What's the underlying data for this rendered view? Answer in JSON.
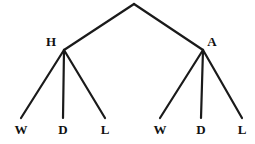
{
  "diagram": {
    "type": "tree",
    "background_color": "#ffffff",
    "stroke_color": "#1a1a1a",
    "text_color": "#111111",
    "stroke_width": 2.2,
    "width": 255,
    "height": 144,
    "nodes": [
      {
        "id": "root",
        "label": "",
        "x": 134,
        "y": 4,
        "level": 0,
        "kind": "root"
      },
      {
        "id": "h",
        "label": "H",
        "x": 64,
        "y": 50,
        "label_x": 51,
        "label_y": 41,
        "level": 1,
        "kind": "internal"
      },
      {
        "id": "a",
        "label": "A",
        "x": 203,
        "y": 50,
        "label_x": 212,
        "label_y": 41,
        "level": 1,
        "kind": "internal"
      },
      {
        "id": "h-w",
        "label": "W",
        "x": 21,
        "y": 118,
        "label_x": 21,
        "label_y": 129,
        "level": 2,
        "kind": "leaf",
        "parent": "h"
      },
      {
        "id": "h-d",
        "label": "D",
        "x": 63,
        "y": 118,
        "label_x": 63,
        "label_y": 129,
        "level": 2,
        "kind": "leaf",
        "parent": "h"
      },
      {
        "id": "h-l",
        "label": "L",
        "x": 105,
        "y": 118,
        "label_x": 105,
        "label_y": 129,
        "level": 2,
        "kind": "leaf",
        "parent": "h"
      },
      {
        "id": "a-w",
        "label": "W",
        "x": 160,
        "y": 118,
        "label_x": 160,
        "label_y": 129,
        "level": 2,
        "kind": "leaf",
        "parent": "a"
      },
      {
        "id": "a-d",
        "label": "D",
        "x": 201,
        "y": 118,
        "label_x": 201,
        "label_y": 129,
        "level": 2,
        "kind": "leaf",
        "parent": "a"
      },
      {
        "id": "a-l",
        "label": "L",
        "x": 242,
        "y": 118,
        "label_x": 242,
        "label_y": 129,
        "level": 2,
        "kind": "leaf",
        "parent": "a"
      }
    ],
    "edges": [
      {
        "id": "root-h",
        "from": "root",
        "to": "h",
        "x1": 134,
        "y1": 4,
        "x2": 64,
        "y2": 50
      },
      {
        "id": "root-a",
        "from": "root",
        "to": "a",
        "x1": 134,
        "y1": 4,
        "x2": 203,
        "y2": 50
      },
      {
        "id": "h-w",
        "from": "h",
        "to": "h-w",
        "x1": 64,
        "y1": 50,
        "x2": 21,
        "y2": 118
      },
      {
        "id": "h-d",
        "from": "h",
        "to": "h-d",
        "x1": 64,
        "y1": 50,
        "x2": 63,
        "y2": 118
      },
      {
        "id": "h-l",
        "from": "h",
        "to": "h-l",
        "x1": 64,
        "y1": 50,
        "x2": 105,
        "y2": 118
      },
      {
        "id": "a-w",
        "from": "a",
        "to": "a-w",
        "x1": 203,
        "y1": 50,
        "x2": 160,
        "y2": 118
      },
      {
        "id": "a-d",
        "from": "a",
        "to": "a-d",
        "x1": 203,
        "y1": 50,
        "x2": 201,
        "y2": 118
      },
      {
        "id": "a-l",
        "from": "a",
        "to": "a-l",
        "x1": 203,
        "y1": 50,
        "x2": 242,
        "y2": 118
      }
    ]
  }
}
